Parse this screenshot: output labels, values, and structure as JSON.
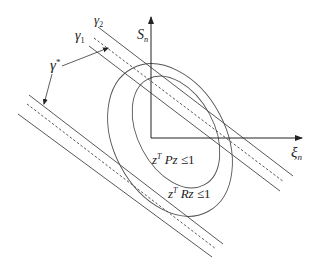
{
  "diagram": {
    "axes": {
      "vertical": {
        "symbol": "S",
        "subscript": "n"
      },
      "horizontal": {
        "symbol": "ξ",
        "subscript": "n"
      }
    },
    "band_labels": {
      "gamma2": {
        "symbol": "γ",
        "subscript": "2"
      },
      "gamma1": {
        "symbol": "γ",
        "subscript": "1"
      },
      "gamma_star": {
        "symbol": "γ",
        "superscript": "*"
      }
    },
    "regions": [
      {
        "var": "z",
        "sup": "T",
        "matrix": "Pz",
        "rel": " ≤1"
      },
      {
        "var": "z",
        "sup": "T",
        "matrix": "Rz",
        "rel": " ≤1"
      }
    ],
    "colors": {
      "stroke": "#444444",
      "text": "#222222",
      "background": "#ffffff"
    }
  }
}
